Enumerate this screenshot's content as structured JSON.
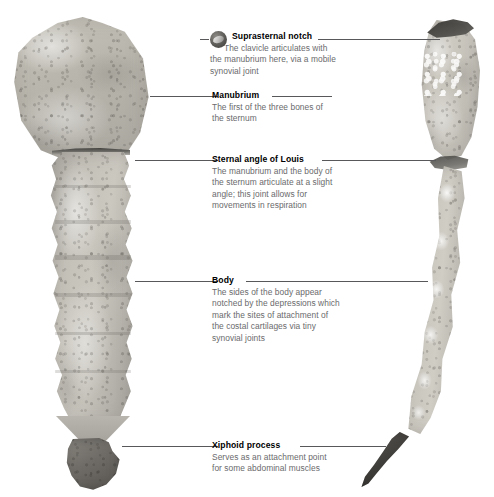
{
  "figure": {
    "background_color": "#ffffff",
    "leader_line_color": "#58585a",
    "heading_color": "#000000",
    "body_text_color": "#6a6a6c"
  },
  "specimens": [
    {
      "name": "anterior-sternum",
      "view": "anterior",
      "parts": [
        "manubrium",
        "sternal angle",
        "body",
        "xiphoid process"
      ]
    },
    {
      "name": "lateral-sternum",
      "view": "lateral",
      "parts": [
        "manubrium",
        "suprasternal notch",
        "sternal angle",
        "body",
        "xiphoid process"
      ]
    }
  ],
  "callouts": [
    {
      "id": "suprasternal-notch",
      "heading": "Suprasternal notch",
      "body": "The clavicle articulates with the manubrium here, via a mobile synovial joint",
      "icon": "photo-thumbnail-icon",
      "has_icon": true
    },
    {
      "id": "manubrium",
      "heading": "Manubrium",
      "body": "The first of the three bones of the sternum",
      "has_icon": false
    },
    {
      "id": "sternal-angle-of-louis",
      "heading": "Sternal angle of Louis",
      "body": "The manubrium and the body of the sternum articulate at a slight angle; this joint allows for movements in respiration",
      "has_icon": false
    },
    {
      "id": "body",
      "heading": "Body",
      "body": "The sides of the body appear notched by the depressions which mark the sites of attachment of the costal cartilages via tiny synovial joints",
      "has_icon": false
    },
    {
      "id": "xiphoid-process",
      "heading": "Xiphoid process",
      "body": "Serves as an attachment point for some abdominal muscles",
      "has_icon": false
    }
  ]
}
